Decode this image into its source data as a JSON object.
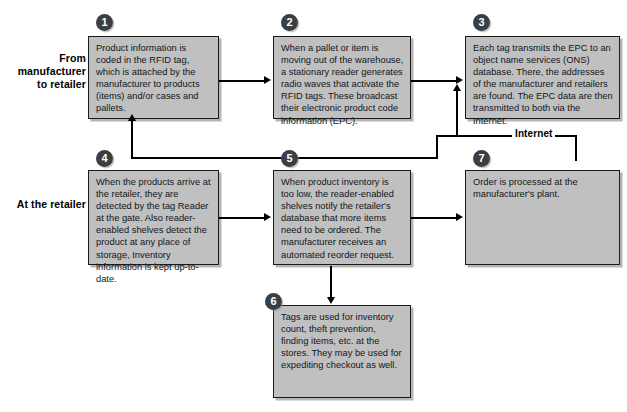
{
  "diagram": {
    "colors": {
      "node_fill": "#c0c0c0",
      "node_border": "#1a1a1a",
      "badge_fill": "#3a3f44",
      "connector": "#000000",
      "background": "#ffffff"
    },
    "row_labels": [
      {
        "id": "row-manufacturer",
        "text": "From\nmanufacturer\nto retailer"
      },
      {
        "id": "row-retailer",
        "text": "At the retailer"
      }
    ],
    "connector_labels": [
      {
        "id": "internet-label",
        "text": "Internet"
      }
    ],
    "nodes": [
      {
        "number": "1",
        "name": "step-1",
        "text": "Product information is coded in the RFID tag, which is attached by the manufacturer to products (items) and/or cases and pallets."
      },
      {
        "number": "2",
        "name": "step-2",
        "text": "When a pallet or item is moving out of the warehouse, a stationary reader generates radio waves that activate the RFID tags. These broadcast their electronic product code information (EPC)."
      },
      {
        "number": "3",
        "name": "step-3",
        "text": "Each tag transmits the EPC to an object name services (ONS) database. There, the addresses of the manufacturer and retailers are found. The EPC data are then transmitted to both via the Internet."
      },
      {
        "number": "4",
        "name": "step-4",
        "text": "When the products arrive at the retailer, they are detected by the tag Reader at the gate. Also reader-enabled shelves detect the product at any place of storage, Inventory information is kept up-to-date."
      },
      {
        "number": "5",
        "name": "step-5",
        "text": "When product inventory is too low, the reader-enabled shelves notify the retailer's database that more items need to be ordered. The manufacturer receives an automated reorder request."
      },
      {
        "number": "6",
        "name": "step-6",
        "text": "Tags are used for inventory count, theft prevention, finding items, etc. at the stores. They may be used for expediting checkout as well."
      },
      {
        "number": "7",
        "name": "step-7",
        "text": "Order is processed at the manufacturer's plant."
      }
    ]
  }
}
